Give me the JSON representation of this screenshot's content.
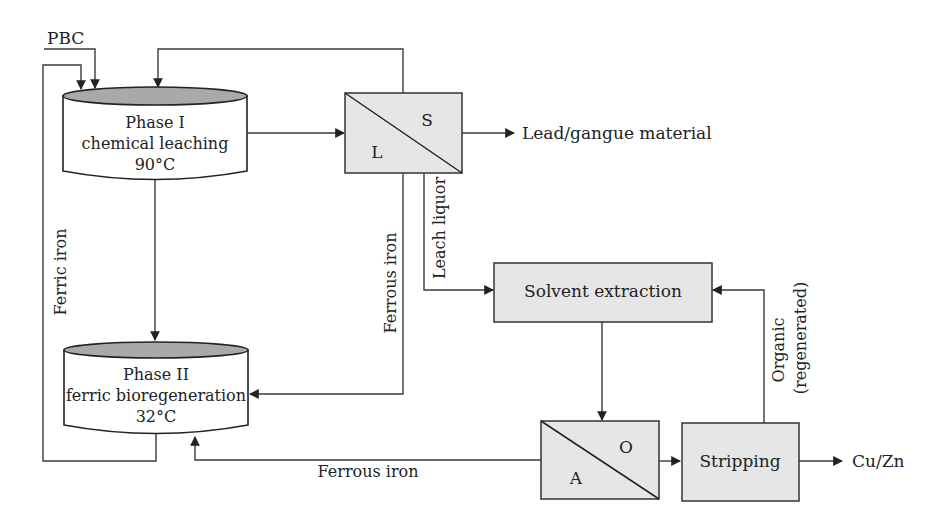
{
  "diagram": {
    "type": "process-flow",
    "colors": {
      "box_fill": "#e6e6e6",
      "tank_top_fill": "#a9a9a9",
      "line": "#3a3a3a",
      "text": "#222222"
    },
    "inputs": {
      "pbc": "PBC"
    },
    "tanks": [
      {
        "id": "phase1",
        "line1": "Phase I",
        "line2": "chemical leaching",
        "line3": "90°C"
      },
      {
        "id": "phase2",
        "line1": "Phase II",
        "line2": "ferric bioregeneration",
        "line3": "32°C"
      }
    ],
    "separators": [
      {
        "id": "ls",
        "top_right": "S",
        "bottom_left": "L"
      },
      {
        "id": "ao",
        "top_right": "O",
        "bottom_left": "A"
      }
    ],
    "boxes": {
      "solvent_extraction": "Solvent extraction",
      "stripping": "Stripping"
    },
    "flow_labels": {
      "ferric_iron": "Ferric iron",
      "ferrous_iron_vertical": "Ferrous iron",
      "leach_liquor": "Leach liquor",
      "ferrous_iron_bottom": "Ferrous iron",
      "organic": "Organic",
      "regenerated": "(regenerated)"
    },
    "outputs": {
      "lead_gangue": "Lead/gangue material",
      "cu_zn": "Cu/Zn"
    }
  }
}
